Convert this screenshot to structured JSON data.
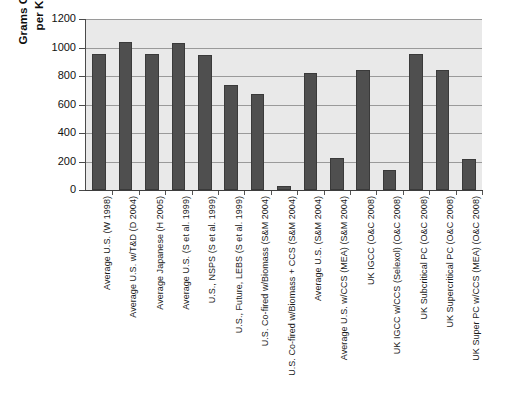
{
  "chart_data": {
    "type": "bar",
    "title": "",
    "xlabel": "",
    "ylabel": "Grams CO2 Equivalent per Kilowatt-hour",
    "ylabel_line1": "Grams CO",
    "ylabel_sub": "2",
    "ylabel_line1_tail": " Equivalent",
    "ylabel_line2": "per Kilowatt-hour",
    "ylim": [
      0,
      1200
    ],
    "ytick_values": [
      0,
      200,
      400,
      600,
      800,
      1000,
      1200
    ],
    "ytick_labels": [
      "0",
      "200",
      "400",
      "600",
      "800",
      "1000",
      "1200"
    ],
    "grid": true,
    "grid_axis": "y",
    "legend": false,
    "bar_color": "#4f4f4f",
    "plot_background": "#e9e9e9",
    "categories": [
      "Average U.S. (W 1998)",
      "Average U.S. w/T&D (D 2004)",
      "Average Japanese (H 2005)",
      "Average U.S. (S et al. 1999)",
      "U.S., NSPS (S et al. 1999)",
      "U.S., Future, LEBS (S et al. 1999)",
      "U.S. Co-fired w/Biomass (S&M 2004)",
      "U.S. Co-fired w/Biomass + CCS (S&M 2004)",
      "Average U.S. (S&M 2004)",
      "Average U.S. w/CCS (MEA) (S&M 2004)",
      "UK IGCC (O&C 2008)",
      "UK IGCC w/CCS (Selexol) (O&C 2008)",
      "UK Subcritical PC (O&C 2008)",
      "UK Supercritical PC (O&C 2008)",
      "UK Super PC w/CCS (MEA) (O&C 2008)"
    ],
    "values": [
      955,
      1040,
      955,
      1030,
      945,
      735,
      675,
      30,
      820,
      225,
      840,
      140,
      955,
      845,
      220
    ]
  }
}
